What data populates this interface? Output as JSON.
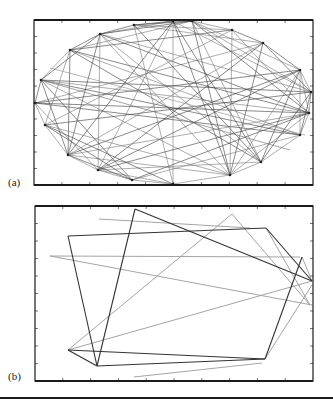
{
  "figure": {
    "panels": [
      {
        "id": "a",
        "label": "(a)",
        "frame": {
          "x": 34,
          "y": 20,
          "w": 279,
          "h": 165
        },
        "description": "Dense graph: 20 vertices arranged roughly on an ellipse, many connecting edges",
        "vertices": [
          [
            35,
            103
          ],
          [
            41,
            80
          ],
          [
            70,
            50
          ],
          [
            100,
            34
          ],
          [
            134,
            25
          ],
          [
            173,
            21
          ],
          [
            192,
            21
          ],
          [
            232,
            30
          ],
          [
            263,
            43
          ],
          [
            300,
            70
          ],
          [
            311,
            92
          ],
          [
            309,
            113
          ],
          [
            300,
            135
          ],
          [
            261,
            162
          ],
          [
            230,
            175
          ],
          [
            173,
            184
          ],
          [
            132,
            180
          ],
          [
            98,
            170
          ],
          [
            68,
            155
          ],
          [
            45,
            125
          ]
        ]
      },
      {
        "id": "b",
        "label": "(b)",
        "frame": {
          "x": 35,
          "y": 206,
          "w": 278,
          "h": 175
        },
        "description": "Sparse route-like graph with dark and light edges",
        "dark_edges": [
          [
            [
              68,
              236
            ],
            [
              266,
              228
            ]
          ],
          [
            [
              266,
              228
            ],
            [
              312,
              281
            ]
          ],
          [
            [
              68,
              236
            ],
            [
              97,
              366
            ]
          ],
          [
            [
              97,
              366
            ],
            [
              135,
              209
            ]
          ],
          [
            [
              135,
              209
            ],
            [
              312,
              281
            ]
          ],
          [
            [
              97,
              366
            ],
            [
              265,
              359
            ]
          ],
          [
            [
              265,
              359
            ],
            [
              302,
              257
            ]
          ],
          [
            [
              68,
              350
            ],
            [
              97,
              366
            ]
          ],
          [
            [
              68,
              350
            ],
            [
              265,
              359
            ]
          ]
        ],
        "light_edges": [
          [
            [
              99,
              219
            ],
            [
              250,
              228
            ]
          ],
          [
            [
              232,
              214
            ],
            [
              68,
              350
            ]
          ],
          [
            [
              232,
              214
            ],
            [
              310,
              305
            ]
          ],
          [
            [
              50,
              256
            ],
            [
              312,
              305
            ]
          ],
          [
            [
              50,
              256
            ],
            [
              300,
              257
            ]
          ],
          [
            [
              68,
              350
            ],
            [
              312,
              281
            ]
          ],
          [
            [
              134,
              377
            ],
            [
              262,
              363
            ]
          ],
          [
            [
              265,
              359
            ],
            [
              312,
              285
            ]
          ],
          [
            [
              266,
              228
            ],
            [
              310,
              305
            ]
          ],
          [
            [
              302,
              257
            ],
            [
              312,
              281
            ]
          ]
        ]
      }
    ],
    "colors": {
      "frame": "#1a1a1a",
      "dark_edge": "#333333",
      "light_edge": "#9a9a9a",
      "dense_edge": "#3a3a3a"
    }
  }
}
